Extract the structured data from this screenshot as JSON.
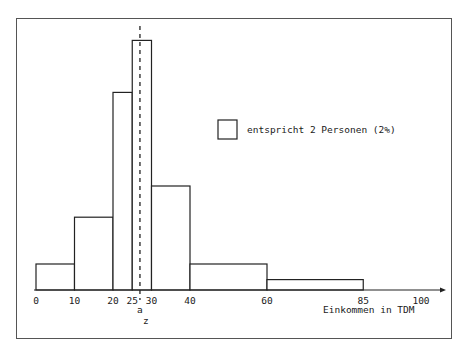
{
  "chart_data": {
    "type": "bar",
    "subtype": "histogram",
    "title": "",
    "xlabel": "Einkommen in TDM",
    "ylabel": "",
    "bins": [
      {
        "from": 0,
        "to": 10,
        "percent": 5
      },
      {
        "from": 10,
        "to": 20,
        "percent": 14
      },
      {
        "from": 20,
        "to": 25,
        "percent": 19
      },
      {
        "from": 25,
        "to": 30,
        "percent": 24
      },
      {
        "from": 30,
        "to": 40,
        "percent": 20
      },
      {
        "from": 40,
        "to": 60,
        "percent": 10
      },
      {
        "from": 60,
        "to": 85,
        "percent": 5
      }
    ],
    "categories": [
      "0-10",
      "10-20",
      "20-25",
      "25-30",
      "30-40",
      "40-60",
      "60-85"
    ],
    "values": [
      5,
      14,
      19,
      24,
      20,
      10,
      5
    ],
    "x_ticks": [
      "0",
      "10",
      "20",
      "25",
      "30",
      "40",
      "60",
      "85",
      "100"
    ],
    "xlim": [
      0,
      105
    ],
    "grid": false,
    "annotations": [
      {
        "text": "a",
        "position": "below axis near x=27 (dashed line)"
      },
      {
        "text": "z",
        "position": "below 'a', near x=28"
      }
    ],
    "dashed_line_x": 27,
    "legend": {
      "symbol": "square",
      "label": "entspricht 2 Personen (2%)",
      "position": "upper right"
    }
  },
  "labels": {
    "xlabel": "Einkommen in TDM",
    "legend": "entspricht 2 Personen (2%)",
    "mark_a": "a",
    "mark_z": "z",
    "ticks": [
      "0",
      "10",
      "20",
      "25",
      "30",
      "40",
      "60",
      "85",
      "100"
    ]
  }
}
